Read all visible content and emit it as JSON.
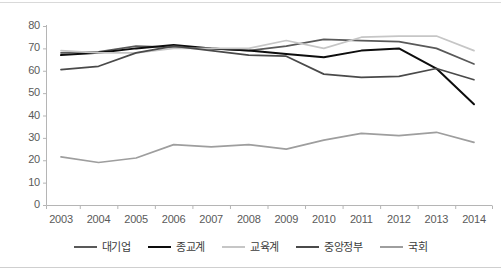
{
  "chart_data": {
    "type": "line",
    "title": "",
    "xlabel": "",
    "ylabel": "",
    "categories": [
      "2003",
      "2004",
      "2005",
      "2006",
      "2007",
      "2008",
      "2009",
      "2010",
      "2011",
      "2012",
      "2013",
      "2014"
    ],
    "ylim": [
      0,
      80
    ],
    "ytick_labels": [
      "0",
      "10",
      "20",
      "30",
      "40",
      "50",
      "60",
      "70",
      "80"
    ],
    "ytick_values": [
      0,
      10,
      20,
      30,
      40,
      50,
      60,
      70,
      80
    ],
    "grid": false,
    "legend_position": "bottom",
    "series": [
      {
        "name": "대기업",
        "color": "#595959",
        "width": 1.7,
        "values": [
          68.0,
          68.5,
          71.0,
          70.5,
          70.0,
          69.0,
          71.0,
          74.0,
          73.5,
          73.0,
          70.0,
          63.0
        ]
      },
      {
        "name": "종교계",
        "color": "#0d0d0d",
        "width": 2.0,
        "values": [
          67.0,
          68.0,
          70.0,
          71.5,
          70.0,
          69.0,
          67.5,
          66.0,
          69.0,
          70.0,
          61.0,
          45.0
        ]
      },
      {
        "name": "교육계",
        "color": "#c6c6c6",
        "width": 1.7,
        "values": [
          69.0,
          68.0,
          68.0,
          70.0,
          70.0,
          70.0,
          73.5,
          70.0,
          75.0,
          75.5,
          75.5,
          69.0
        ]
      },
      {
        "name": "중앙정부",
        "color": "#4a4a4a",
        "width": 1.7,
        "values": [
          60.5,
          62.0,
          68.0,
          71.0,
          69.0,
          67.0,
          66.5,
          58.5,
          57.0,
          57.5,
          61.0,
          56.0
        ]
      },
      {
        "name": "국회",
        "color": "#9e9e9e",
        "width": 1.7,
        "values": [
          21.5,
          19.0,
          21.0,
          27.0,
          26.0,
          27.0,
          25.0,
          29.0,
          32.0,
          31.0,
          32.5,
          28.0
        ]
      }
    ]
  },
  "legend": {
    "items": [
      {
        "label": "대기업",
        "color": "#595959"
      },
      {
        "label": "종교계",
        "color": "#0d0d0d"
      },
      {
        "label": "교육계",
        "color": "#c6c6c6"
      },
      {
        "label": "중앙정부",
        "color": "#4a4a4a"
      },
      {
        "label": "국회",
        "color": "#9e9e9e"
      }
    ]
  },
  "axes": {
    "axis_color": "#b5b5b5",
    "tick_color": "#5a5a5a"
  }
}
